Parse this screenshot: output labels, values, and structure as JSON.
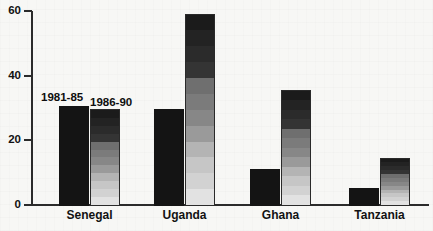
{
  "chart_data": {
    "type": "bar",
    "title": "",
    "subtitle": "",
    "xlabel": "",
    "ylabel": "",
    "ylim": [
      0,
      60
    ],
    "yticks": [
      0,
      20,
      40,
      60
    ],
    "ytick_labels": [
      "0",
      "20",
      "40",
      "60"
    ],
    "grid": false,
    "legend_position": "inline-annotation-above-first-group",
    "categories": [
      "Senegal",
      "Uganda",
      "Ghana",
      "Tanzania"
    ],
    "series": [
      {
        "name": "1981-85",
        "style": "solid-black",
        "color": "#141414",
        "values": [
          31,
          30,
          11.5,
          5.5
        ]
      },
      {
        "name": "1986-90",
        "style": "banded-gradient",
        "color": "#8f8f8f",
        "values": [
          30,
          59.5,
          36,
          15
        ]
      }
    ],
    "annotations": [
      {
        "text": "1981-85",
        "target": "Senegal / 1981-85 bar"
      },
      {
        "text": "1986-90",
        "target": "Senegal / 1986-90 bar"
      }
    ]
  },
  "axis": {
    "y_ticks": [
      {
        "label": "60",
        "value": 60
      },
      {
        "label": "40",
        "value": 40
      },
      {
        "label": "20",
        "value": 20
      },
      {
        "label": "0",
        "value": 0
      }
    ]
  },
  "colors": {
    "axis": "#2b2b2b",
    "series_1981_85": "#141414",
    "series_1986_90": "#8f8f8f",
    "background": "#f7f7f5",
    "text": "#111111"
  }
}
